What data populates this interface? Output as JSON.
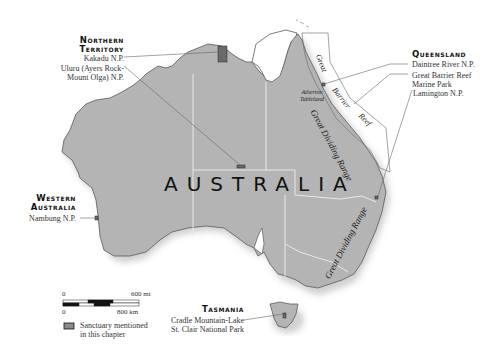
{
  "map": {
    "country_label": "AUSTRALIA",
    "colors": {
      "land": "#b4b4b4",
      "land_shadow": "#d8d8d8",
      "coast": "#555555",
      "border": "#e6e6e6",
      "sanctuary": "#6d6d6d",
      "leader": "#666666"
    },
    "regions": {
      "northern_territory": {
        "title_line1": "Northern",
        "title_line2": "Territory",
        "items": [
          "Kakadu N.P.",
          "Uluru (Ayers Rock-",
          "Mount Olga) N.P."
        ]
      },
      "queensland": {
        "title": "Queensland",
        "items": [
          "Daintree River N.P.",
          "Great Barrier Reef",
          "Marine Park",
          "Lamington N.P."
        ]
      },
      "western_australia": {
        "title_line1": "Western",
        "title_line2": "Australia",
        "items": [
          "Nambung N.P."
        ]
      },
      "tasmania": {
        "title": "Tasmania",
        "items": [
          "Cradle Mountain-Lake",
          "St. Clair National Park"
        ]
      }
    },
    "features": {
      "reef_words": [
        "Great",
        "Barrier",
        "Reef"
      ],
      "range_north": "Great Dividing Range",
      "range_south": "Great Dividing Range",
      "atherton_line1": "Atherton",
      "atherton_line2": "Tableland"
    },
    "scale": {
      "mi_start": "0",
      "mi_end": "600 mi",
      "km_start": "0",
      "km_end": "800 km"
    },
    "legend": {
      "line1": "Sanctuary mentioned",
      "line2": "in this chapter"
    }
  }
}
